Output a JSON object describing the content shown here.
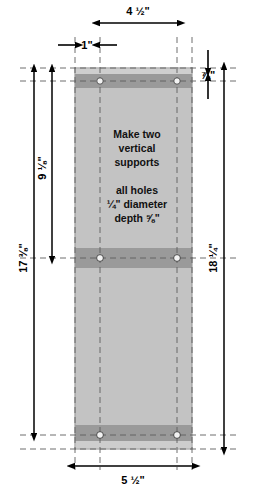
{
  "drawing": {
    "title": "vertical-support-board-dimensioned-drawing",
    "units": "inches",
    "notes": {
      "line1": "Make two",
      "line2": "vertical",
      "line3": "supports",
      "line4": "all holes",
      "line5": "¼\" diameter",
      "line6": "depth ⅝\""
    },
    "dimensions": {
      "top_width": "4 ½\"",
      "edge_offset": "1\"",
      "top_band_height": "⅞\"",
      "left_upper": "9 ⅛\"",
      "left_overall": "17 ⅜\"",
      "right_overall": "18 ¼\"",
      "bottom_width": "5 ½\""
    },
    "colors": {
      "board_face": "#c3c3c3",
      "board_band": "#9a9a9a",
      "board_top_strip": "#cfcfcf",
      "board_bottom_strip": "#cdcdcd",
      "outline": "#9d9d9d",
      "dimension_line": "#000000",
      "center_line": "#7a7a7a",
      "hole_fill": "#f2f2f2",
      "background": "#ffffff"
    },
    "geometry": {
      "board_left": 75,
      "board_right": 192,
      "board_top": 68,
      "board_bottom": 449,
      "hole_x_left": 100,
      "hole_x_right": 177,
      "hole_y_top": 81,
      "hole_y_middle": 258,
      "hole_y_bottom": 435,
      "hole_radius": 3
    }
  }
}
